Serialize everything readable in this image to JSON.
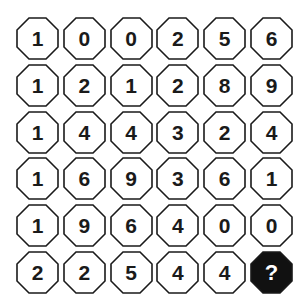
{
  "puzzle": {
    "rows": [
      [
        "1",
        "0",
        "0",
        "2",
        "5",
        "6"
      ],
      [
        "1",
        "2",
        "1",
        "2",
        "8",
        "9"
      ],
      [
        "1",
        "4",
        "4",
        "3",
        "2",
        "4"
      ],
      [
        "1",
        "6",
        "9",
        "3",
        "6",
        "1"
      ],
      [
        "1",
        "9",
        "6",
        "4",
        "0",
        "0"
      ],
      [
        "2",
        "2",
        "5",
        "4",
        "4",
        "?"
      ]
    ],
    "mystery_cell": {
      "row": 5,
      "col": 5,
      "label": "?"
    },
    "colors": {
      "cell_fill": "#ffffff",
      "cell_stroke": "#1a1a1a",
      "mystery_fill": "#111111",
      "mystery_text": "#ffffff",
      "text": "#1a1a1a"
    }
  }
}
